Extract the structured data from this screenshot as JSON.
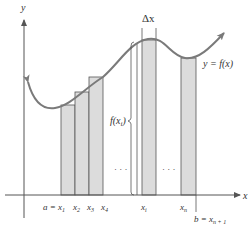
{
  "figure": {
    "type": "riemann-sum-left-endpoints",
    "axes": {
      "x_label": "x",
      "y_label": "y"
    },
    "curve_label": "y = f(x)",
    "delta_label": "Δx",
    "height_label": "f(x",
    "height_label_sub": "i",
    "height_label_close": ")",
    "ellipsis": "· · ·",
    "tick_labels": {
      "a": "a = x",
      "a_sub": "1",
      "x2": "x",
      "x2_sub": "2",
      "x3": "x",
      "x3_sub": "3",
      "x4": "x",
      "x4_sub": "4",
      "xi": "x",
      "xi_sub": "i",
      "xn": "x",
      "xn_sub": "n",
      "b": "b = x",
      "b_sub": "n + 1"
    },
    "colors": {
      "bar_fill": "#dcdcdc",
      "bar_stroke": "#555555",
      "curve": "#7a7a7a",
      "axis": "#555555",
      "text": "#333333"
    }
  }
}
